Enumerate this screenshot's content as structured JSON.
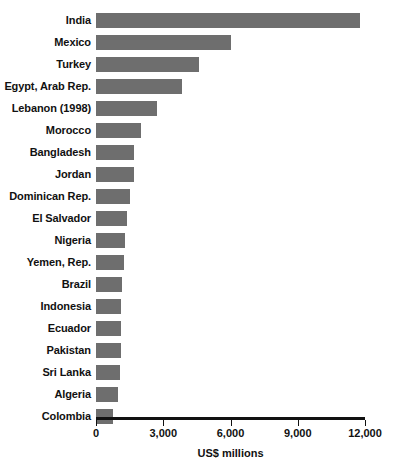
{
  "chart_data": {
    "type": "bar",
    "orientation": "horizontal",
    "title": "",
    "xlabel": "US$ millions",
    "ylabel": "",
    "xlim": [
      0,
      12000
    ],
    "xticks": [
      0,
      3000,
      6000,
      9000,
      12000
    ],
    "xticklabels": [
      "0",
      "3,000",
      "6,000",
      "9,000",
      "12,000"
    ],
    "grid": false,
    "legend": null,
    "bar_color": "#6e6e6e",
    "categories": [
      "India",
      "Mexico",
      "Turkey",
      "Egypt, Arab Rep.",
      "Lebanon (1998)",
      "Morocco",
      "Bangladesh",
      "Jordan",
      "Dominican Rep.",
      "El Salvador",
      "Nigeria",
      "Yemen, Rep.",
      "Brazil",
      "Indonesia",
      "Ecuador",
      "Pakistan",
      "Sri Lanka",
      "Algeria",
      "Colombia"
    ],
    "values": [
      11780,
      6030,
      4600,
      3840,
      2720,
      2010,
      1700,
      1700,
      1520,
      1380,
      1300,
      1250,
      1160,
      1120,
      1120,
      1120,
      1070,
      980,
      760
    ]
  },
  "axis": {
    "title": "US$ millions"
  }
}
